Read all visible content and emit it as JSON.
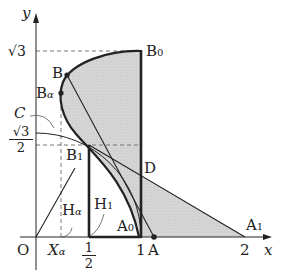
{
  "labels": {
    "y_axis": "y",
    "x_axis": "x",
    "origin": "O",
    "sqrt3": "√3",
    "sqrt3_half_num": "√3",
    "sqrt3_half_den": "2",
    "half_num": "1",
    "half_den": "2",
    "one": "1",
    "two": "2",
    "B0": "B",
    "B0_sub": "0",
    "B": "B",
    "Balpha": "B",
    "Balpha_sub": "α",
    "C": "C",
    "B1": "B",
    "B1_sub": "1",
    "D": "D",
    "H1": "H",
    "H1_sub": "1",
    "Halpha": "H",
    "Halpha_sub": "α",
    "A0": "A",
    "A0_sub": "0",
    "A": "A",
    "A1": "A",
    "A1_sub": "1",
    "Xalpha": "X",
    "Xalpha_sub": "α"
  },
  "colors": {
    "shade": "#d4d4d4",
    "line": "#222222",
    "dash": "#777777"
  }
}
